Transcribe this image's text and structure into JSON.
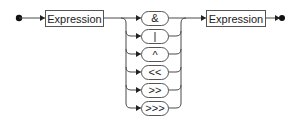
{
  "diagram": {
    "type": "railroad",
    "start_node": "start",
    "nonterminals": [
      {
        "id": "expr1",
        "label": "Expression"
      },
      {
        "id": "expr2",
        "label": "Expression"
      }
    ],
    "terminals": [
      {
        "label": "&"
      },
      {
        "label": "|"
      },
      {
        "label": "^"
      },
      {
        "label": "<<"
      },
      {
        "label": ">>"
      },
      {
        "label": ">>>"
      }
    ],
    "end_node": "end",
    "colors": {
      "line": "#4a4a4a",
      "box_border": "#555555",
      "text": "#222222"
    }
  }
}
